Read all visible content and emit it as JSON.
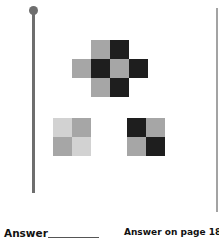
{
  "colors": {
    "black": "#1e1e1e",
    "gray": "#a6a6a6",
    "light": "#d2d2d2",
    "pole": "#6e6e6e"
  },
  "cross_pattern": {
    "cells": [
      {
        "row": 0,
        "col": 1,
        "shade": "gray"
      },
      {
        "row": 0,
        "col": 2,
        "shade": "black"
      },
      {
        "row": 1,
        "col": 0,
        "shade": "gray"
      },
      {
        "row": 1,
        "col": 1,
        "shade": "black"
      },
      {
        "row": 1,
        "col": 2,
        "shade": "gray"
      },
      {
        "row": 1,
        "col": 3,
        "shade": "black"
      },
      {
        "row": 2,
        "col": 1,
        "shade": "gray"
      },
      {
        "row": 2,
        "col": 2,
        "shade": "black"
      }
    ]
  },
  "option_left": {
    "cells": [
      {
        "row": 0,
        "col": 0,
        "shade": "light"
      },
      {
        "row": 0,
        "col": 1,
        "shade": "gray"
      },
      {
        "row": 1,
        "col": 0,
        "shade": "gray"
      },
      {
        "row": 1,
        "col": 1,
        "shade": "light"
      }
    ]
  },
  "option_right": {
    "cells": [
      {
        "row": 0,
        "col": 0,
        "shade": "black"
      },
      {
        "row": 0,
        "col": 1,
        "shade": "gray"
      },
      {
        "row": 1,
        "col": 0,
        "shade": "gray"
      },
      {
        "row": 1,
        "col": 1,
        "shade": "black"
      }
    ]
  },
  "footer": {
    "answer_label": "Answer",
    "answer_reference": "Answer on page 184"
  }
}
